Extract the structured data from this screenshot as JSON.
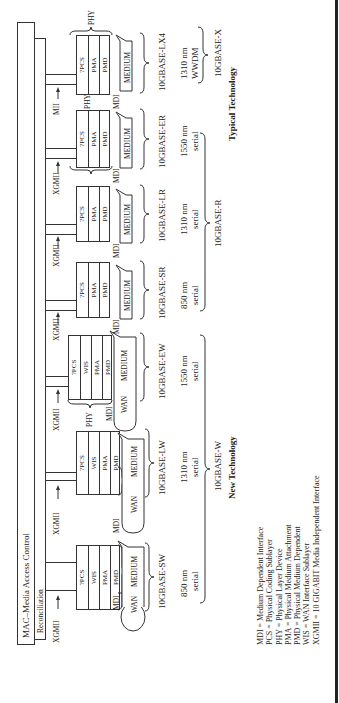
{
  "layers": {
    "mac": "MAC–Media Access Control",
    "reconciliation": "Reconciliation"
  },
  "columns": [
    {
      "name": "10GBASE-SW",
      "iface": "XGMII",
      "sublayers": [
        "?PCS",
        "WIS",
        "PMA",
        "PMD"
      ],
      "medium": "MEDIUM",
      "wan": "WAN",
      "mdi": "MDI",
      "phy": "PHY",
      "wavelength": "850 nm",
      "mode": "serial",
      "wan_cloud": true
    },
    {
      "name": "10GBASE-LW",
      "iface": "XGMII",
      "sublayers": [
        "?PCS",
        "WIS",
        "PMA",
        "PMD"
      ],
      "medium": "MEDIUM",
      "wan": "WAN",
      "mdi": "MDI",
      "phy": "PHY",
      "wavelength": "1310 nm",
      "mode": "serial",
      "wan_cloud": true
    },
    {
      "name": "10GBASE-EW",
      "iface": "XGMII",
      "sublayers": [
        "?PCS",
        "WIS",
        "PMA",
        "PMD"
      ],
      "medium": "MEDIUM",
      "wan": "WAN",
      "mdi": "MDI",
      "phy": "PHY",
      "wavelength": "1550 nm",
      "mode": "serial",
      "wan_cloud": true
    },
    {
      "name": "10GBASE-SR",
      "iface": "XGMII",
      "sublayers": [
        "?PCS",
        "PMA",
        "PMD"
      ],
      "medium": "MEDIUM",
      "mdi": "MDI",
      "wavelength": "850 nm",
      "mode": "serial"
    },
    {
      "name": "10GBASE-LR",
      "iface": "XGMII",
      "sublayers": [
        "?PCS",
        "PMA",
        "PMD"
      ],
      "medium": "MEDIUM",
      "mdi": "MDI",
      "wavelength": "1310 nm",
      "mode": "serial"
    },
    {
      "name": "10GBASE-ER",
      "iface": "XGMII",
      "sublayers": [
        "?PCS",
        "PMA",
        "PMD"
      ],
      "medium": "MEDIUM",
      "mdi": "MDI",
      "phy": "PHY",
      "wavelength": "1550 nm",
      "mode": "serial"
    },
    {
      "name": "10GBASE-LX4",
      "iface": "MII",
      "sublayers": [
        "?PCS",
        "PMA",
        "PMD"
      ],
      "medium": "MEDIUM",
      "mdi": "MDI",
      "phy": "PHY",
      "wavelength": "1310 nm",
      "mode": "WWDM"
    }
  ],
  "groups": {
    "w": "10GBASE-W",
    "r": "10GBASE-R",
    "x": "10GBASE-X"
  },
  "categories": {
    "new": "New Technology",
    "typical": "Typical Technology"
  },
  "legend": [
    "MDI = Medium Dependent Interface",
    "PCS = Physical Coding Sublayer",
    "PHY = Physical Layer Device",
    "PMA = Physical Medium Attachment",
    "PMD = Physical Medium Dependent",
    "WIS = WAN Interface Sublayer",
    "XGMII = 10 GIGABIT Media Independent Interface"
  ]
}
